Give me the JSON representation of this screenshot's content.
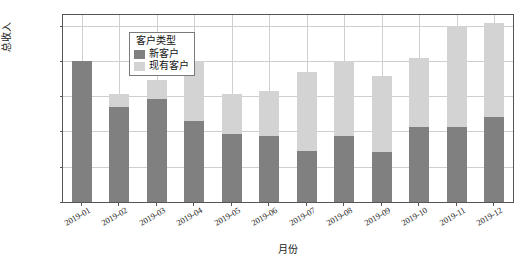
{
  "chart_data": {
    "type": "bar",
    "stacked": true,
    "title": "",
    "xlabel": "月份",
    "ylabel": "总收入",
    "ylim": [
      0,
      530000
    ],
    "yticks": [
      0,
      100000,
      200000,
      300000,
      400000,
      500000
    ],
    "ytick_labels": [
      "0",
      "100000",
      "200000",
      "300000",
      "400000",
      "500000"
    ],
    "grid": true,
    "categories": [
      "2019-01",
      "2019-02",
      "2019-03",
      "2019-04",
      "2019-05",
      "2019-06",
      "2019-07",
      "2019-08",
      "2019-09",
      "2019-10",
      "2019-11",
      "2019-12"
    ],
    "legend": {
      "title": "客户类型",
      "position": "upper-left-inside",
      "entries": [
        {
          "name": "新客户",
          "color": "#808080"
        },
        {
          "name": "现有客户",
          "color": "#d3d3d3"
        }
      ]
    },
    "series": [
      {
        "name": "新客户",
        "color": "#808080",
        "values": [
          399000,
          269000,
          292000,
          229000,
          192000,
          188000,
          145000,
          188000,
          143000,
          212000,
          212000,
          240000
        ]
      },
      {
        "name": "现有客户",
        "color": "#d3d3d3",
        "values": [
          0,
          37000,
          53000,
          171000,
          113000,
          126000,
          224000,
          211000,
          213000,
          196000,
          286000,
          268000
        ]
      }
    ],
    "totals": [
      399000,
      306000,
      345000,
      400000,
      305000,
      314000,
      369000,
      399000,
      356000,
      408000,
      498000,
      508000
    ]
  },
  "style": {
    "axis_color": "#555555",
    "grid_color": "#cfcfcf",
    "background": "#ffffff",
    "text_color": "#1a1a1a"
  }
}
